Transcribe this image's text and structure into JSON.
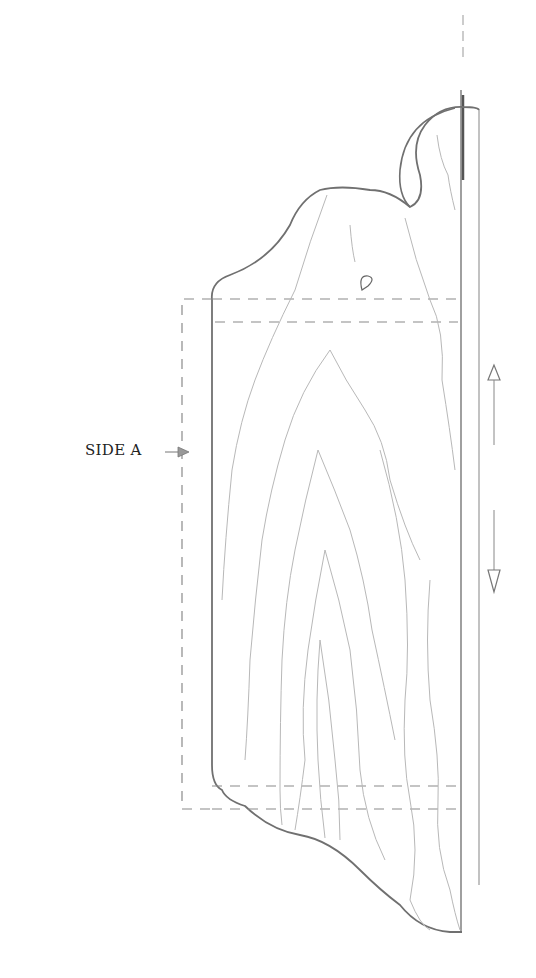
{
  "drawing": {
    "title": "Side panel pattern",
    "labels": {
      "side_label": "SIDE A"
    },
    "annotations": {
      "side_arrow": "arrow pointing right toward side A",
      "grain_arrows": "double arrow (up / down) indicating grain direction"
    },
    "colors": {
      "outline": "#707070",
      "grain": "#b8b8b8",
      "dashed": "#8a8a8a",
      "text": "#222222"
    }
  }
}
